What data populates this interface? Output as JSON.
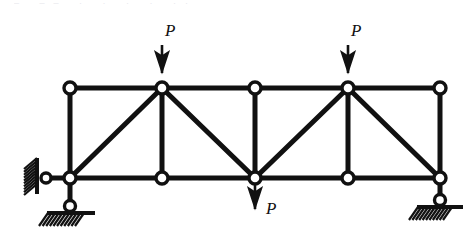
{
  "figure": {
    "type": "structural-truss-diagram",
    "title_artifact": "– ––  ·   · ·   ·  ··",
    "stroke_color": "#111111",
    "node_fill_color": "#ffffff",
    "background_color": "#ffffff",
    "member_thickness_px": 5,
    "node_radius_px": 6
  },
  "geometry": {
    "top_chord_y": 88,
    "bottom_chord_y": 178,
    "panel_x": [
      70,
      162,
      255,
      348,
      440
    ],
    "nodes": [
      {
        "id": "U1",
        "name": "top-left-node",
        "x": 70,
        "y": 88
      },
      {
        "id": "U2",
        "name": "top-node-load-left",
        "x": 162,
        "y": 88
      },
      {
        "id": "U3",
        "name": "top-mid-node",
        "x": 255,
        "y": 88
      },
      {
        "id": "U4",
        "name": "top-node-load-right",
        "x": 348,
        "y": 88
      },
      {
        "id": "U5",
        "name": "top-right-node",
        "x": 440,
        "y": 88
      },
      {
        "id": "L1",
        "name": "bottom-left-support-node",
        "x": 70,
        "y": 178
      },
      {
        "id": "L2",
        "name": "bottom-node-2",
        "x": 162,
        "y": 178
      },
      {
        "id": "L3",
        "name": "bottom-mid-node-load",
        "x": 255,
        "y": 178
      },
      {
        "id": "L4",
        "name": "bottom-node-4",
        "x": 348,
        "y": 178
      },
      {
        "id": "L5",
        "name": "bottom-right-support-node",
        "x": 440,
        "y": 178
      }
    ],
    "chords": [
      {
        "name": "top-chord",
        "x1": 70,
        "y1": 88,
        "x2": 440,
        "y2": 88
      },
      {
        "name": "bottom-chord",
        "x1": 70,
        "y1": 178,
        "x2": 440,
        "y2": 178
      }
    ],
    "verticals": [
      {
        "name": "vertical-1",
        "x": 70,
        "y1": 88,
        "y2": 178
      },
      {
        "name": "vertical-2",
        "x": 162,
        "y1": 88,
        "y2": 178
      },
      {
        "name": "vertical-3",
        "x": 255,
        "y1": 88,
        "y2": 178
      },
      {
        "name": "vertical-4",
        "x": 348,
        "y1": 88,
        "y2": 178
      },
      {
        "name": "vertical-5",
        "x": 440,
        "y1": 88,
        "y2": 178
      }
    ],
    "diagonals": [
      {
        "name": "diagonal-1",
        "x1": 70,
        "y1": 178,
        "x2": 162,
        "y2": 88
      },
      {
        "name": "diagonal-2",
        "x1": 162,
        "y1": 88,
        "x2": 255,
        "y2": 178
      },
      {
        "name": "diagonal-3",
        "x1": 255,
        "y1": 178,
        "x2": 348,
        "y2": 88
      },
      {
        "name": "diagonal-4",
        "x1": 348,
        "y1": 88,
        "x2": 440,
        "y2": 178
      }
    ]
  },
  "supports": {
    "left_wall_link": {
      "name": "left-wall-pin-link",
      "wall_x": 37,
      "wall_top": 158,
      "wall_bottom": 194,
      "hatch_width": 15,
      "link_from_x": 46,
      "link_to_x": 70,
      "link_y": 178,
      "pin_x": 46,
      "pin_y": 178
    },
    "bottom_left_roller": {
      "name": "bottom-left-roller-support",
      "link_x": 70,
      "link_from_y": 178,
      "link_to_y": 206,
      "pin_x": 70,
      "pin_y": 206,
      "ground_y": 213,
      "ground_x1": 47,
      "ground_x2": 95
    },
    "bottom_right_roller": {
      "name": "bottom-right-roller-support",
      "link_x": 440,
      "link_from_y": 178,
      "link_to_y": 200,
      "pin_x": 440,
      "pin_y": 200,
      "ground_y": 207,
      "ground_x1": 417,
      "ground_x2": 463
    }
  },
  "loads": [
    {
      "id": "load-top-left",
      "name": "load-arrow-top-left",
      "label": "P",
      "direction": "down",
      "x": 162,
      "tail_y": 45,
      "head_y": 82,
      "label_x": 165,
      "label_y": 22
    },
    {
      "id": "load-top-right",
      "name": "load-arrow-top-right",
      "label": "P",
      "direction": "down",
      "x": 348,
      "tail_y": 45,
      "head_y": 82,
      "label_x": 351,
      "label_y": 22
    },
    {
      "id": "load-bottom-mid",
      "name": "load-arrow-bottom-mid",
      "label": "P",
      "direction": "down",
      "x": 255,
      "tail_y": 184,
      "head_y": 218,
      "label_x": 266,
      "label_y": 200
    }
  ]
}
